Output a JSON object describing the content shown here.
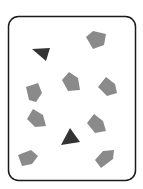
{
  "figure": {
    "background": "#ffffff",
    "frame": {
      "x": 8.5,
      "y": 16.5,
      "width": 127,
      "height": 164,
      "rx": 10,
      "stroke": "#1a1a1a",
      "stroke_width": 1.5,
      "fill": "#ffffff"
    },
    "colors": {
      "dark": "#333333",
      "light": "#8a8a8a"
    },
    "shapes": [
      {
        "id": "dark-triangle-1",
        "kind": "triangle",
        "tone": "dark",
        "points": "32,49 50,48 46,61"
      },
      {
        "id": "pentagon-top-right",
        "kind": "pentagon",
        "tone": "light",
        "points": "86,37 93,31 106,34 104,45 93,49"
      },
      {
        "id": "pentagon-middle",
        "kind": "pentagon",
        "tone": "light",
        "points": "62,80 69,72 78,78 80,90 68,91"
      },
      {
        "id": "pentagon-right",
        "kind": "pentagon",
        "tone": "light",
        "points": "98,87 106,77 115,84 117,93 107,96"
      },
      {
        "id": "pentagon-left",
        "kind": "pentagon",
        "tone": "light",
        "points": "26,87 38,83 42,93 36,102 29,100"
      },
      {
        "id": "pentagon-left-lower",
        "kind": "pentagon",
        "tone": "light",
        "points": "27,119 33,109 43,115 46,126 35,127"
      },
      {
        "id": "pentagon-right-lower",
        "kind": "pentagon",
        "tone": "light",
        "points": "87,123 94,114 103,121 106,131 95,133"
      },
      {
        "id": "dark-triangle-2",
        "kind": "triangle",
        "tone": "dark",
        "points": "70,128 80,142 61,145"
      },
      {
        "id": "pentagon-bottom-left",
        "kind": "pentagon",
        "tone": "light",
        "points": "18,155 31,150 38,156 32,164 22,166"
      },
      {
        "id": "pentagon-bottom-right",
        "kind": "pentagon",
        "tone": "light",
        "points": "95,160 103,151 114,150 113,159 101,168"
      }
    ]
  }
}
